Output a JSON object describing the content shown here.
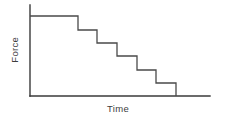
{
  "chart_data": {
    "type": "line",
    "subtype": "step",
    "title": "",
    "xlabel": "Time",
    "ylabel": "Force",
    "grid": false,
    "legend": null,
    "axis_ticks": {
      "x": [],
      "y": []
    },
    "axes": {
      "x_axis_pixel_y": 96,
      "y_axis_pixel_x": 30,
      "y_axis_top_pixel_y": 5,
      "x_axis_right_pixel_x": 210
    },
    "step_count": 6,
    "x": [
      0,
      1,
      2,
      3,
      4,
      5,
      6
    ],
    "values": [
      6,
      5,
      4,
      3,
      2,
      1,
      0
    ],
    "xlim": [
      0,
      8
    ],
    "ylim": [
      0,
      7
    ],
    "points_pixel": [
      {
        "x": 30,
        "y": 16
      },
      {
        "x": 78,
        "y": 16
      },
      {
        "x": 78,
        "y": 30
      },
      {
        "x": 97,
        "y": 30
      },
      {
        "x": 97,
        "y": 43
      },
      {
        "x": 117,
        "y": 43
      },
      {
        "x": 117,
        "y": 56
      },
      {
        "x": 137,
        "y": 56
      },
      {
        "x": 137,
        "y": 70
      },
      {
        "x": 156,
        "y": 70
      },
      {
        "x": 156,
        "y": 83
      },
      {
        "x": 176,
        "y": 83
      },
      {
        "x": 176,
        "y": 96
      }
    ],
    "colors": {
      "background": "#ffffff",
      "axis": "#3a3a3a",
      "series": "#4a4a4a",
      "text": "#3d3d3d"
    }
  }
}
